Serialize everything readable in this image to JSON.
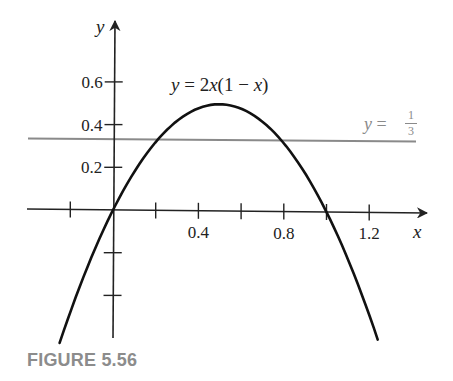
{
  "caption": "FIGURE 5.56",
  "colors": {
    "curve": "#111111",
    "axes": "#222222",
    "reference_line": "#8a8a8a",
    "caption": "#8c8c8c"
  },
  "labels": {
    "x_axis": "x",
    "y_axis": "y",
    "curve_label": "y = 2x(1 − x)",
    "curve_label_parts": {
      "y": "y",
      "eq": " = 2",
      "x1": "x",
      "mid": "(1 − ",
      "x2": "x",
      "end": ")"
    },
    "line_label": {
      "y": "y",
      "eq": " = ",
      "num": "1",
      "den": "3"
    }
  },
  "ticks": {
    "x": [
      {
        "value": -0.2,
        "label": ""
      },
      {
        "value": 0.2,
        "label": ""
      },
      {
        "value": 0.4,
        "label": "0.4"
      },
      {
        "value": 0.6,
        "label": ""
      },
      {
        "value": 0.8,
        "label": "0.8"
      },
      {
        "value": 1.0,
        "label": ""
      },
      {
        "value": 1.2,
        "label": "1.2"
      }
    ],
    "y": [
      {
        "value": 0.6,
        "label": "0.6"
      },
      {
        "value": 0.4,
        "label": "0.4"
      },
      {
        "value": 0.2,
        "label": "0.2"
      },
      {
        "value": -0.2,
        "label": ""
      },
      {
        "value": -0.4,
        "label": ""
      }
    ]
  },
  "chart_data": {
    "type": "line",
    "title": "",
    "xlabel": "x",
    "ylabel": "y",
    "xlim": [
      -0.4,
      1.5
    ],
    "ylim": [
      -0.6,
      0.9
    ],
    "grid": false,
    "series": [
      {
        "name": "y = 2x(1 − x)",
        "function": "2x(1-x)",
        "x": [
          -0.25,
          -0.2,
          -0.1,
          0,
          0.1,
          0.2,
          0.3,
          0.4,
          0.5,
          0.6,
          0.7,
          0.8,
          0.9,
          1.0,
          1.1,
          1.2,
          1.24
        ],
        "y": [
          -0.625,
          -0.48,
          -0.22,
          0,
          0.18,
          0.32,
          0.42,
          0.48,
          0.5,
          0.48,
          0.42,
          0.32,
          0.18,
          0,
          -0.22,
          -0.48,
          -0.595
        ]
      },
      {
        "name": "y = 1/3",
        "function": "1/3",
        "x": [
          -0.4,
          1.42
        ],
        "y": [
          0.3333,
          0.3333
        ]
      }
    ],
    "annotations": [
      "y = 2x(1 − x)",
      "y = 1/3"
    ],
    "x_tick_labels": [
      "0.4",
      "0.8",
      "1.2"
    ],
    "y_tick_labels": [
      "0.2",
      "0.4",
      "0.6"
    ]
  }
}
